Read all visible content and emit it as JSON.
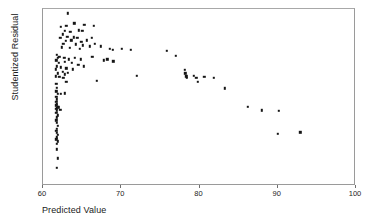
{
  "chart_data": {
    "type": "scatter",
    "title": "",
    "xlabel": "Predicted Value",
    "ylabel": "Studentized Residual",
    "xlim": [
      60,
      100
    ],
    "ylim": [
      -3,
      2
    ],
    "xticks": [
      60,
      70,
      80,
      90,
      100
    ],
    "yticks": [
      2,
      1,
      0,
      -1,
      -2,
      -3
    ],
    "xtick_labels": [
      "60",
      "70",
      "80",
      "90",
      "100"
    ],
    "ytick_labels": [
      "2",
      "1",
      "0",
      "-1",
      "-2",
      "-3"
    ],
    "grid": false,
    "legend": null,
    "marker": "square",
    "marker_color": "#151515",
    "series": [
      {
        "name": "residuals",
        "points": [
          [
            63.2,
            1.88
          ],
          [
            62.3,
            1.5
          ],
          [
            63.0,
            1.52
          ],
          [
            64.0,
            1.6
          ],
          [
            65.3,
            1.55
          ],
          [
            66.5,
            1.52
          ],
          [
            62.8,
            1.38
          ],
          [
            63.5,
            1.35
          ],
          [
            64.6,
            1.4
          ],
          [
            65.0,
            1.38
          ],
          [
            62.5,
            1.28
          ],
          [
            63.1,
            1.22
          ],
          [
            63.9,
            1.2
          ],
          [
            64.4,
            1.18
          ],
          [
            62.2,
            1.18
          ],
          [
            62.9,
            1.1
          ],
          [
            63.6,
            1.12
          ],
          [
            64.9,
            1.08
          ],
          [
            65.6,
            1.12
          ],
          [
            66.2,
            1.18
          ],
          [
            62.6,
            1.02
          ],
          [
            64.2,
            1.0
          ],
          [
            65.1,
            0.98
          ],
          [
            66.0,
            0.95
          ],
          [
            66.6,
            1.02
          ],
          [
            67.4,
            0.95
          ],
          [
            62.4,
            0.92
          ],
          [
            63.4,
            0.9
          ],
          [
            64.7,
            0.88
          ],
          [
            68.5,
            0.88
          ],
          [
            68.9,
            0.85
          ],
          [
            70.1,
            0.88
          ],
          [
            71.2,
            0.85
          ],
          [
            75.8,
            0.82
          ],
          [
            77.0,
            0.68
          ],
          [
            61.8,
            0.7
          ],
          [
            61.9,
            0.62
          ],
          [
            62.1,
            0.65
          ],
          [
            62.7,
            0.62
          ],
          [
            63.3,
            0.58
          ],
          [
            64.1,
            0.62
          ],
          [
            64.8,
            0.58
          ],
          [
            66.3,
            0.65
          ],
          [
            61.7,
            0.55
          ],
          [
            62.0,
            0.48
          ],
          [
            62.8,
            0.5
          ],
          [
            63.7,
            0.48
          ],
          [
            64.5,
            0.42
          ],
          [
            65.2,
            0.38
          ],
          [
            68.2,
            0.58
          ],
          [
            69.0,
            0.52
          ],
          [
            67.8,
            0.55
          ],
          [
            61.8,
            0.38
          ],
          [
            62.3,
            0.35
          ],
          [
            63.0,
            0.32
          ],
          [
            63.8,
            0.3
          ],
          [
            61.6,
            0.3
          ],
          [
            62.5,
            0.22
          ],
          [
            63.2,
            0.2
          ],
          [
            61.9,
            0.18
          ],
          [
            62.8,
            0.15
          ],
          [
            78.1,
            0.28
          ],
          [
            78.2,
            0.18
          ],
          [
            78.3,
            0.1
          ],
          [
            78.4,
            0.05
          ],
          [
            79.3,
            0.12
          ],
          [
            79.6,
            0.05
          ],
          [
            79.8,
            -0.05
          ],
          [
            80.6,
            0.08
          ],
          [
            81.8,
            0.06
          ],
          [
            72.0,
            0.12
          ],
          [
            61.6,
            0.1
          ],
          [
            62.1,
            0.08
          ],
          [
            62.6,
            0.05
          ],
          [
            63.0,
            -0.05
          ],
          [
            66.9,
            -0.02
          ],
          [
            83.2,
            -0.24
          ],
          [
            61.7,
            -0.12
          ],
          [
            61.8,
            -0.22
          ],
          [
            61.7,
            -0.32
          ],
          [
            61.9,
            -0.4
          ],
          [
            61.7,
            -0.48
          ],
          [
            61.8,
            -0.55
          ],
          [
            62.3,
            -0.4
          ],
          [
            62.8,
            -0.38
          ],
          [
            61.7,
            -0.62
          ],
          [
            61.8,
            -0.68
          ],
          [
            61.7,
            -0.72
          ],
          [
            61.9,
            -0.76
          ],
          [
            61.8,
            -0.8
          ],
          [
            61.7,
            -0.82
          ],
          [
            62.0,
            -0.78
          ],
          [
            62.2,
            -0.84
          ],
          [
            61.8,
            -0.88
          ],
          [
            61.7,
            -0.94
          ],
          [
            61.9,
            -1.0
          ],
          [
            61.8,
            -1.06
          ],
          [
            61.7,
            -1.14
          ],
          [
            61.8,
            -1.22
          ],
          [
            61.9,
            -1.3
          ],
          [
            61.8,
            -1.38
          ],
          [
            61.7,
            -1.44
          ],
          [
            61.8,
            -1.5
          ],
          [
            61.9,
            -1.56
          ],
          [
            61.8,
            -1.62
          ],
          [
            61.7,
            -1.68
          ],
          [
            61.9,
            -1.74
          ],
          [
            61.8,
            -1.8
          ],
          [
            61.8,
            -1.96
          ],
          [
            61.9,
            -2.22
          ],
          [
            61.8,
            -2.48
          ],
          [
            86.2,
            -0.76
          ],
          [
            88.0,
            -0.86
          ],
          [
            90.1,
            -0.88
          ],
          [
            90.0,
            -1.52
          ],
          [
            92.9,
            -1.48
          ]
        ]
      }
    ]
  },
  "axes": {
    "y_title": "Studentized Residual",
    "x_title": "Predicted Value"
  }
}
